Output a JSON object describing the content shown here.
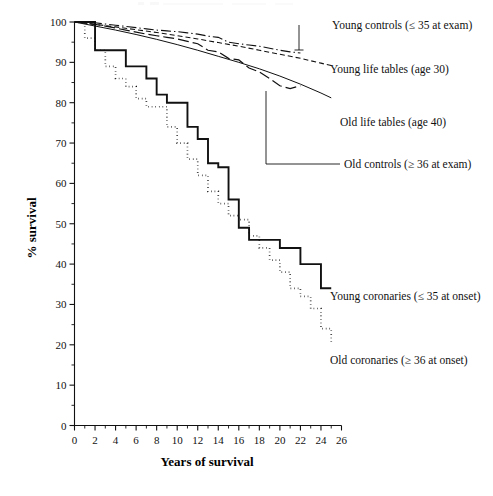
{
  "figure": {
    "background_color": "#ffffff",
    "ink_color": "#111111"
  },
  "axes": {
    "x_title": "Years of survival",
    "y_title": "% survival",
    "x_ticks": [
      "0",
      "2",
      "4",
      "6",
      "8",
      "10",
      "12",
      "14",
      "16",
      "18",
      "20",
      "22",
      "24",
      "26"
    ],
    "y_ticks": [
      "0",
      "10",
      "20",
      "30",
      "40",
      "50",
      "60",
      "70",
      "80",
      "90",
      "100"
    ]
  },
  "annotations": [
    {
      "id": "young-controls",
      "label": "Young controls (≤ 35 at exam)"
    },
    {
      "id": "young-life-tables",
      "label": "Young life tables (age 30)"
    },
    {
      "id": "old-life-tables",
      "label": "Old life tables (age 40)"
    },
    {
      "id": "old-controls",
      "label": "Old controls (≥ 36 at exam)"
    },
    {
      "id": "young-coronaries",
      "label": "Young coronaries (≤ 35 at onset)"
    },
    {
      "id": "old-coronaries",
      "label": "Old coronaries (≥ 36 at onset)"
    }
  ],
  "chart_data": {
    "type": "line",
    "title": "",
    "subtitle": "",
    "xlabel": "Years of survival",
    "ylabel": "% survival",
    "xlim": [
      0,
      26
    ],
    "ylim": [
      0,
      100
    ],
    "x_tick_step": 2,
    "x_minor_tick_step": 1,
    "y_tick_step": 10,
    "y_minor_tick_step": 5,
    "grid": false,
    "legend_position": "inline-annotations-right",
    "series": [
      {
        "name": "Young controls (≤ 35 at exam)",
        "style": "dash-dot",
        "stroke_width": 1.1,
        "x": [
          0,
          1,
          2,
          3,
          4,
          5,
          6,
          7,
          8,
          9,
          10,
          11,
          12,
          13,
          14,
          15,
          16,
          17,
          18,
          19,
          20,
          21,
          22
        ],
        "y": [
          100,
          100,
          99.8,
          99.5,
          99.2,
          98.9,
          98.6,
          98.3,
          98.0,
          97.8,
          97.6,
          97.3,
          97.0,
          96.5,
          96.2,
          95.0,
          94.6,
          94.3,
          94.0,
          93.5,
          93.0,
          92.6,
          92.3
        ]
      },
      {
        "name": "Young life tables (age 30)",
        "style": "short-dash",
        "stroke_width": 1.1,
        "x": [
          0,
          2,
          4,
          6,
          8,
          10,
          12,
          14,
          16,
          18,
          20,
          22,
          24,
          25
        ],
        "y": [
          100,
          99.4,
          98.8,
          98.1,
          97.4,
          96.6,
          95.8,
          94.9,
          94.0,
          93.0,
          92.0,
          91.0,
          89.8,
          89.2
        ]
      },
      {
        "name": "Old controls (≥ 36 at exam)",
        "style": "long-dash",
        "stroke_width": 1.2,
        "x": [
          0,
          1,
          2,
          3,
          4,
          5,
          6,
          7,
          8,
          9,
          10,
          11,
          12,
          13,
          14,
          15,
          16,
          17,
          18,
          19,
          20,
          21,
          22
        ],
        "y": [
          100,
          99.8,
          99.4,
          99.0,
          98.5,
          98.0,
          97.5,
          97.0,
          96.6,
          96.2,
          95.8,
          95.2,
          94.6,
          93.0,
          92.6,
          91.0,
          90.6,
          88.6,
          87.6,
          86.0,
          84.2,
          83.5,
          84.2
        ]
      },
      {
        "name": "Old life tables (age 40)",
        "style": "solid-thin",
        "stroke_width": 1.0,
        "x": [
          0,
          2,
          4,
          6,
          8,
          10,
          12,
          14,
          16,
          18,
          20,
          22,
          24,
          25
        ],
        "y": [
          100,
          99.0,
          98.0,
          96.9,
          95.7,
          94.4,
          93.0,
          91.5,
          90.0,
          88.4,
          86.6,
          84.6,
          82.4,
          81.2
        ]
      },
      {
        "name": "Young coronaries (≤ 35 at onset)",
        "style": "solid-thick",
        "stroke_width": 1.9,
        "step": true,
        "x": [
          0,
          1,
          2,
          3,
          4,
          5,
          6,
          7,
          8,
          9,
          10,
          11,
          12,
          13,
          14,
          15,
          16,
          17,
          18,
          19,
          20,
          21,
          22,
          23,
          24,
          25
        ],
        "y": [
          100,
          100,
          93,
          93,
          93,
          89,
          89,
          86,
          82,
          80,
          80,
          74,
          71,
          65,
          64,
          56,
          49,
          46,
          46,
          46,
          44,
          44,
          40,
          40,
          34,
          34
        ]
      },
      {
        "name": "Old coronaries (≥ 36 at onset)",
        "style": "dotted",
        "stroke_width": 1.7,
        "step": true,
        "x": [
          0,
          1,
          2,
          3,
          4,
          5,
          6,
          7,
          8,
          9,
          10,
          11,
          12,
          13,
          14,
          15,
          16,
          17,
          18,
          19,
          20,
          21,
          22,
          23,
          24,
          25
        ],
        "y": [
          100,
          96,
          93,
          89,
          86,
          84,
          81,
          79,
          79,
          74,
          70,
          66,
          62,
          58,
          55,
          52,
          51,
          47,
          44,
          41,
          38,
          34,
          32,
          29,
          24,
          20
        ]
      }
    ]
  }
}
